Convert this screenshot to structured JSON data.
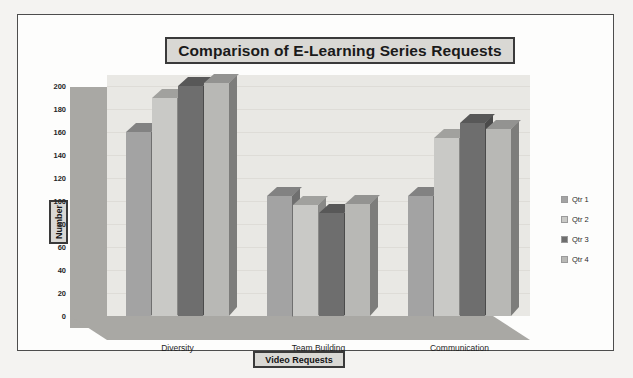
{
  "chart_data": {
    "type": "bar",
    "title": "Comparison of E-Learning Series Requests",
    "xlabel": "Video Requests",
    "ylabel": "Number",
    "categories": [
      "Diversity",
      "Team Building",
      "Communication"
    ],
    "series": [
      {
        "name": "Qtr 1",
        "color": "#a3a3a3",
        "values": [
          160,
          105,
          105
        ]
      },
      {
        "name": "Qtr 2",
        "color": "#c9c9c6",
        "values": [
          190,
          97,
          155
        ]
      },
      {
        "name": "Qtr 3",
        "color": "#6e6e6e",
        "values": [
          200,
          90,
          168
        ]
      },
      {
        "name": "Qtr 4",
        "color": "#b8b8b5",
        "values": [
          203,
          98,
          163
        ]
      }
    ],
    "ylim": [
      0,
      210
    ],
    "yticks": [
      0,
      20,
      40,
      60,
      80,
      100,
      120,
      140,
      160,
      180,
      200
    ],
    "ytick_labels": [
      "0",
      "20",
      "40",
      "60",
      "80",
      "100",
      "120",
      "140",
      "160",
      "180",
      "200"
    ],
    "grid": true,
    "legend_position": "right",
    "three_d": true
  },
  "colors": {
    "title_box_fill": "#d9d8d4",
    "title_box_border": "#3a3a3a",
    "plot_back_wall": "#e9e8e4",
    "plot_side_wall": "#a9a8a4",
    "figure_border": "#4d4d4d",
    "page_background": "#f4f3f1"
  }
}
